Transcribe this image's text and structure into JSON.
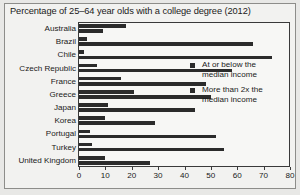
{
  "chart_data": {
    "type": "bar",
    "orientation": "horizontal",
    "title": "Percentage of 25–64 year olds with a college degree (2012)",
    "xlabel": "",
    "ylabel": "",
    "xlim": [
      0,
      80
    ],
    "xticks": [
      0,
      10,
      20,
      30,
      40,
      50,
      60,
      70,
      80
    ],
    "grid": false,
    "legend_position": "inside-right",
    "categories": [
      "Australia",
      "Brazil",
      "Chile",
      "Czech Republic",
      "France",
      "Greece",
      "Japan",
      "Korea",
      "Portugal",
      "Turkey",
      "United Kingdom"
    ],
    "series": [
      {
        "name": "At or below the median income",
        "values": [
          18,
          3,
          2,
          7,
          16,
          21,
          11,
          10,
          4,
          5,
          10
        ]
      },
      {
        "name": "More than 2x the median income",
        "values": [
          9,
          66,
          73,
          58,
          48,
          50,
          44,
          29,
          52,
          55,
          27
        ]
      }
    ],
    "colors": {
      "bar": "#2b2b2b",
      "axis": "#3a3a3a",
      "text": "#1a1a1a",
      "plot_background": "#f7f7f5",
      "figure_background": "#f2f2f0",
      "page_background": "#e8e8e6"
    }
  },
  "legend": {
    "items": [
      {
        "line1": "At or below the",
        "line2": "median income"
      },
      {
        "line1": "More than 2x the",
        "line2": "median income"
      }
    ]
  }
}
